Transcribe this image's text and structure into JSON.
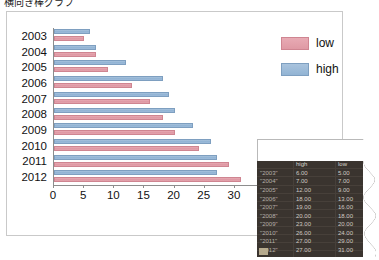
{
  "page": {
    "title": "横向き棒グラフ"
  },
  "chart_data": {
    "type": "bar",
    "orientation": "horizontal",
    "title": "",
    "xlabel": "",
    "ylabel": "",
    "xlim": [
      0,
      33
    ],
    "ylim": null,
    "grid": false,
    "legend_position": "right",
    "categories": [
      "2003",
      "2004",
      "2005",
      "2006",
      "2007",
      "2008",
      "2009",
      "2010",
      "2011",
      "2012"
    ],
    "xticks": [
      "0",
      "5",
      "10",
      "15",
      "20",
      "25",
      "30"
    ],
    "xtick_values": [
      0,
      5,
      10,
      15,
      20,
      25,
      30
    ],
    "series": [
      {
        "name": "high",
        "color": "#92b4d4",
        "values": [
          6.0,
          7.0,
          12.0,
          18.0,
          19.0,
          20.0,
          23.0,
          26.0,
          27.0,
          27.0
        ]
      },
      {
        "name": "low",
        "color": "#df99a4",
        "values": [
          5.0,
          7.0,
          9.0,
          13.0,
          16.0,
          18.0,
          20.0,
          24.0,
          29.0,
          31.0
        ]
      }
    ]
  },
  "legend": {
    "items": [
      {
        "label": "low",
        "swatch": "low"
      },
      {
        "label": "high",
        "swatch": "high"
      }
    ]
  },
  "data_table": {
    "headers": [
      "",
      "high",
      "low"
    ],
    "rows": [
      {
        "year": "\"2003\"",
        "high": "6.00",
        "low": "5.00"
      },
      {
        "year": "\"2004\"",
        "high": "7.00",
        "low": "7.00"
      },
      {
        "year": "\"2005\"",
        "high": "12.00",
        "low": "9.00"
      },
      {
        "year": "\"2006\"",
        "high": "18.00",
        "low": "13.00"
      },
      {
        "year": "\"2007\"",
        "high": "19.00",
        "low": "16.00"
      },
      {
        "year": "\"2008\"",
        "high": "20.00",
        "low": "18.00"
      },
      {
        "year": "\"2009\"",
        "high": "23.00",
        "low": "20.00"
      },
      {
        "year": "\"2010\"",
        "high": "26.00",
        "low": "24.00"
      },
      {
        "year": "\"2011\"",
        "high": "27.00",
        "low": "29.00"
      },
      {
        "year": "\"2012\"",
        "high": "27.00",
        "low": "31.00"
      }
    ]
  }
}
